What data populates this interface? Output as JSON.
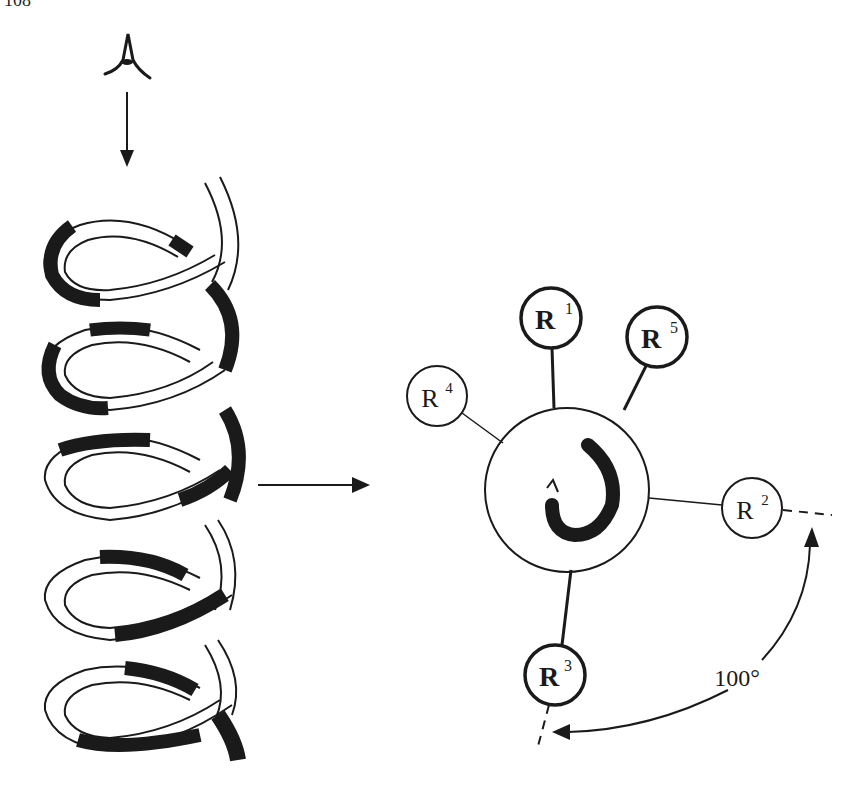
{
  "page": {
    "number": "108"
  },
  "figure": {
    "left_panel": {
      "description": "Alpha-helix viewed along axis",
      "viewer_icon": "eye-icon",
      "view_arrow": "down-arrow-icon",
      "helix_turns": 5
    },
    "transition_arrow": "right-arrow-icon",
    "right_panel": {
      "description": "Helical wheel projection",
      "center_glyph": "rotation-arrow-icon",
      "residues": [
        {
          "label": "R",
          "index": "1",
          "style": "bold"
        },
        {
          "label": "R",
          "index": "2",
          "style": "normal"
        },
        {
          "label": "R",
          "index": "3",
          "style": "bold"
        },
        {
          "label": "R",
          "index": "4",
          "style": "normal"
        },
        {
          "label": "R",
          "index": "5",
          "style": "bold"
        }
      ],
      "angle_label": "100°"
    }
  },
  "colors": {
    "ink": "#1a1a1a",
    "background": "#ffffff"
  }
}
